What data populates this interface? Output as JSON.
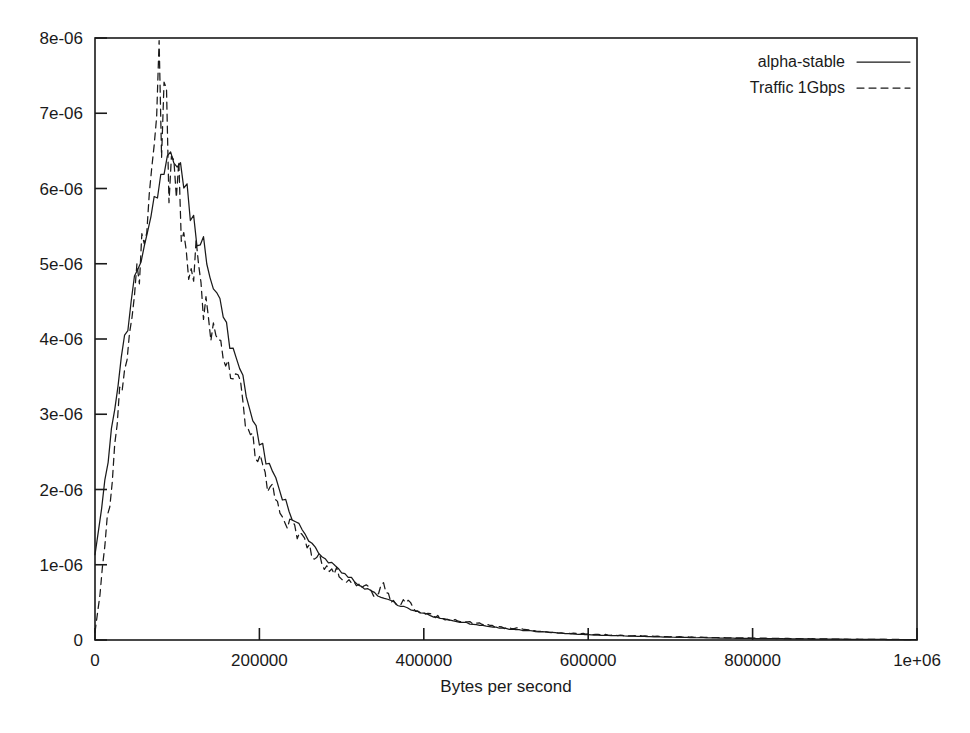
{
  "chart_data": {
    "type": "line",
    "title": "",
    "subtitle": "",
    "xlabel": "Bytes per second",
    "ylabel": "",
    "xlim": [
      0,
      1000000
    ],
    "ylim": [
      0,
      8e-06
    ],
    "grid": false,
    "legend_position": "top-right",
    "x_ticks": [
      {
        "value": 0,
        "label": "0"
      },
      {
        "value": 200000,
        "label": "200000"
      },
      {
        "value": 400000,
        "label": "400000"
      },
      {
        "value": 600000,
        "label": "600000"
      },
      {
        "value": 800000,
        "label": "800000"
      },
      {
        "value": 1000000,
        "label": "1e+06"
      }
    ],
    "y_ticks": [
      {
        "value": 0,
        "label": "0"
      },
      {
        "value": 1e-06,
        "label": "1e-06"
      },
      {
        "value": 2e-06,
        "label": "2e-06"
      },
      {
        "value": 3e-06,
        "label": "3e-06"
      },
      {
        "value": 4e-06,
        "label": "4e-06"
      },
      {
        "value": 5e-06,
        "label": "5e-06"
      },
      {
        "value": 6e-06,
        "label": "6e-06"
      },
      {
        "value": 7e-06,
        "label": "7e-06"
      },
      {
        "value": 8e-06,
        "label": "8e-06"
      }
    ],
    "series": [
      {
        "name": "alpha-stable",
        "style": "solid",
        "color": "#1a1a1a",
        "x": [
          0,
          10000,
          20000,
          30000,
          40000,
          50000,
          60000,
          70000,
          75000,
          80000,
          85000,
          90000,
          95000,
          100000,
          105000,
          110000,
          115000,
          120000,
          125000,
          130000,
          140000,
          150000,
          160000,
          170000,
          180000,
          190000,
          200000,
          210000,
          220000,
          230000,
          240000,
          250000,
          260000,
          270000,
          280000,
          290000,
          300000,
          310000,
          320000,
          330000,
          340000,
          350000,
          360000,
          370000,
          380000,
          390000,
          400000,
          420000,
          440000,
          460000,
          480000,
          500000,
          520000,
          540000,
          560000,
          580000,
          600000,
          640000,
          680000,
          720000,
          760000,
          800000,
          840000,
          880000,
          920000,
          960000,
          1000000
        ],
        "y": [
          1.15e-06,
          1.95e-06,
          2.75e-06,
          3.5e-06,
          4.2e-06,
          4.85e-06,
          5.4e-06,
          5.55e-06,
          5.95e-06,
          6.1e-06,
          6.2e-06,
          6.45e-06,
          6.3e-06,
          6.45e-06,
          6.2e-06,
          6.15e-06,
          5.75e-06,
          5.7e-06,
          5.35e-06,
          5.3e-06,
          4.95e-06,
          4.55e-06,
          4.1e-06,
          3.75e-06,
          3.4e-06,
          3e-06,
          2.65e-06,
          2.35e-06,
          2.1e-06,
          1.85e-06,
          1.65e-06,
          1.5e-06,
          1.35e-06,
          1.2e-06,
          1.1e-06,
          1e-06,
          9e-07,
          8.2e-07,
          7.5e-07,
          6.8e-07,
          6.2e-07,
          5.6e-07,
          5.1e-07,
          4.6e-07,
          4.2e-07,
          3.8e-07,
          3.5e-07,
          2.9e-07,
          2.5e-07,
          2.1e-07,
          1.8e-07,
          1.5e-07,
          1.3e-07,
          1.1e-07,
          9.5e-08,
          8.2e-08,
          7e-08,
          5.5e-08,
          4.2e-08,
          3.3e-08,
          2.6e-08,
          2e-08,
          1.6e-08,
          1.2e-08,
          9e-09,
          7e-09,
          5e-09
        ]
      },
      {
        "name": "Traffic 1Gbps",
        "style": "dashed",
        "color": "#1a1a1a",
        "x": [
          0,
          5000,
          12000,
          20000,
          28000,
          36000,
          44000,
          52000,
          58000,
          62000,
          66000,
          70000,
          74000,
          78000,
          82000,
          86000,
          90000,
          94000,
          98000,
          102000,
          106000,
          112000,
          118000,
          124000,
          130000,
          136000,
          142000,
          150000,
          158000,
          166000,
          174000,
          182000,
          190000,
          198000,
          206000,
          214000,
          222000,
          230000,
          240000,
          250000,
          260000,
          270000,
          280000,
          290000,
          300000,
          310000,
          320000,
          330000,
          340000,
          350000,
          360000,
          370000,
          380000,
          390000,
          400000,
          420000,
          440000,
          460000,
          480000,
          500000,
          520000,
          540000,
          560000,
          600000,
          640000,
          680000,
          720000,
          760000,
          800000,
          840000,
          880000,
          920000,
          960000,
          1000000
        ],
        "y": [
          1e-07,
          5e-07,
          1.25e-06,
          2.1e-06,
          2.95e-06,
          3.7e-06,
          4.35e-06,
          4.75e-06,
          5.5e-06,
          5.2e-06,
          6e-06,
          7e-06,
          6.3e-06,
          7.55e-06,
          6.6e-06,
          7.2e-06,
          6.1e-06,
          6.5e-06,
          5.6e-06,
          6e-06,
          5.3e-06,
          5.35e-06,
          4.8e-06,
          5e-06,
          4.5e-06,
          4.5e-06,
          4.1e-06,
          4.05e-06,
          3.6e-06,
          3.35e-06,
          3.4e-06,
          3e-06,
          2.7e-06,
          2.4e-06,
          2.2e-06,
          2e-06,
          1.8e-06,
          1.65e-06,
          1.5e-06,
          1.35e-06,
          1.2e-06,
          1.12e-06,
          1e-06,
          9.5e-07,
          8.5e-07,
          8e-07,
          7e-07,
          6.9e-07,
          5.9e-07,
          7.3e-07,
          5.2e-07,
          4.5e-07,
          5.5e-07,
          3.9e-07,
          3.6e-07,
          3e-07,
          2.6e-07,
          2.3e-07,
          1.9e-07,
          1.6e-07,
          1.5e-07,
          1.2e-07,
          1e-07,
          8e-08,
          6e-08,
          5e-08,
          4e-08,
          3e-08,
          2.5e-08,
          2e-08,
          1.5e-08,
          1e-08,
          8e-09,
          5e-09
        ]
      }
    ]
  },
  "legend": {
    "entries": [
      {
        "label": "alpha-stable",
        "style": "solid"
      },
      {
        "label": "Traffic 1Gbps",
        "style": "dashed"
      }
    ]
  },
  "axes": {
    "x_title": "Bytes per second",
    "y_title": ""
  }
}
